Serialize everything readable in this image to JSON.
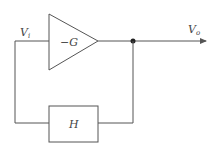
{
  "diagram": {
    "type": "feedback-block-diagram",
    "input_label": {
      "main": "V",
      "sub": "i"
    },
    "output_label": {
      "main": "V",
      "sub": "o"
    },
    "amplifier": {
      "label": "−G",
      "shape": "triangle"
    },
    "feedback_block": {
      "label": "H",
      "shape": "rectangle"
    },
    "junction": "dot",
    "colors": {
      "line": "#555555",
      "text": "#444444",
      "background": "#ffffff"
    }
  }
}
